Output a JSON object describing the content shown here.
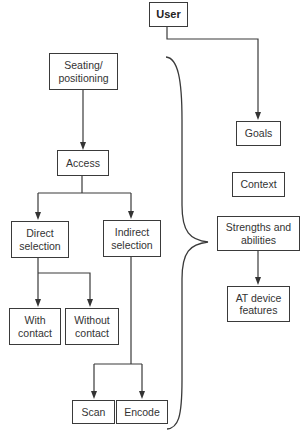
{
  "diagram": {
    "type": "flowchart",
    "nodes": {
      "user": {
        "label": "User"
      },
      "seating": {
        "label": "Seating/\npositioning"
      },
      "access": {
        "label": "Access"
      },
      "direct": {
        "label": "Direct\nselection"
      },
      "indirect": {
        "label": "Indirect\nselection"
      },
      "with_contact": {
        "label": "With\ncontact"
      },
      "without_contact": {
        "label": "Without\ncontact"
      },
      "scan": {
        "label": "Scan"
      },
      "encode": {
        "label": "Encode"
      },
      "goals": {
        "label": "Goals"
      },
      "context": {
        "label": "Context"
      },
      "strengths": {
        "label": "Strengths and\nabilities"
      },
      "at_device": {
        "label": "AT device\nfeatures"
      }
    },
    "edges": [
      {
        "from": "User",
        "to": "Goals"
      },
      {
        "from": "Seating/positioning",
        "to": "Access"
      },
      {
        "from": "Access",
        "to": "Direct selection"
      },
      {
        "from": "Access",
        "to": "Indirect selection"
      },
      {
        "from": "Direct selection",
        "to": "With contact"
      },
      {
        "from": "Direct selection",
        "to": "Without contact"
      },
      {
        "from": "Indirect selection",
        "to": "Scan"
      },
      {
        "from": "Indirect selection",
        "to": "Encode"
      },
      {
        "from": "Strengths and abilities",
        "to": "AT device features"
      }
    ],
    "brace": {
      "groups": "Seating/positioning through Scan/Encode",
      "points_to": "Strengths and abilities"
    },
    "colors": {
      "stroke": "#3a3a3a",
      "background": "#ffffff",
      "text": "#333333"
    }
  }
}
